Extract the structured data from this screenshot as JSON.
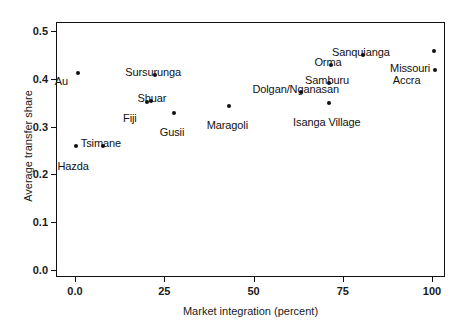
{
  "chart_data": {
    "type": "scatter",
    "title": "",
    "xlabel": "Market integration (percent)",
    "ylabel": "Average transfer share",
    "xlim": [
      -5,
      104
    ],
    "ylim": [
      0.0,
      0.533
    ],
    "xticks": [
      "0.0",
      "25",
      "50",
      "75",
      "100"
    ],
    "xtick_values": [
      0,
      25,
      50,
      75,
      100
    ],
    "yticks": [
      "0.0",
      "0.1",
      "0.2",
      "0.3",
      "0.4",
      "0.5"
    ],
    "ytick_values": [
      0.0,
      0.1,
      0.2,
      0.3,
      0.4,
      0.5
    ],
    "grid": false,
    "legend": null,
    "marker_color": "#111111",
    "points": [
      {
        "label": "Au",
        "x": 0.6,
        "y": 0.414,
        "label_dx": -17,
        "label_dy": 3
      },
      {
        "label": "Hazda",
        "x": 0.0,
        "y": 0.261,
        "label_dx": -3,
        "label_dy": 15
      },
      {
        "label": "Tsimane",
        "x": 7.5,
        "y": 0.261,
        "label_dx": -2,
        "label_dy": -8
      },
      {
        "label": "Fiji",
        "x": 19.9,
        "y": 0.354,
        "label_dx": -17,
        "label_dy": 11
      },
      {
        "label": "Shuar",
        "x": 21.0,
        "y": 0.356,
        "label_dx": 1,
        "label_dy": -8
      },
      {
        "label": "Sursurunga",
        "x": 22.2,
        "y": 0.41,
        "label_dx": -2,
        "label_dy": -8
      },
      {
        "label": "Gusii",
        "x": 27.5,
        "y": 0.331,
        "label_dx": -2,
        "label_dy": 14
      },
      {
        "label": "Maragoli",
        "x": 42.9,
        "y": 0.346,
        "label_dx": -2,
        "label_dy": 14
      },
      {
        "label": "Dolgan/Nganasan",
        "x": 63.0,
        "y": 0.374,
        "label_dx": -5,
        "label_dy": -8
      },
      {
        "label": "Isanga Village",
        "x": 70.9,
        "y": 0.352,
        "label_dx": -2,
        "label_dy": 14
      },
      {
        "label": "Samburu",
        "x": 70.9,
        "y": 0.393,
        "label_dx": -2,
        "label_dy": -8
      },
      {
        "label": "Orma",
        "x": 71.4,
        "y": 0.432,
        "label_dx": -3,
        "label_dy": -8
      },
      {
        "label": "Sanquianga",
        "x": 80.4,
        "y": 0.452,
        "label_dx": -2,
        "label_dy": -8
      },
      {
        "label": "Accra",
        "x": 100.5,
        "y": 0.421,
        "label_dx": -28,
        "label_dy": 5
      },
      {
        "label": "Missouri",
        "x": 100.3,
        "y": 0.461,
        "label_dx": -24,
        "label_dy": 12
      }
    ]
  }
}
